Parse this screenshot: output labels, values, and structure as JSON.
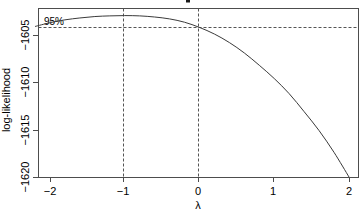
{
  "chart_data": {
    "type": "line",
    "title": "",
    "xlabel": "λ",
    "ylabel": "log-likelihood",
    "xlim": [
      -2.2,
      2.05
    ],
    "ylim": [
      -1620.4,
      -1602.6
    ],
    "grid": false,
    "legend": null,
    "xticks": [
      -2,
      -1,
      0,
      1,
      2
    ],
    "xtick_labels": [
      "−2",
      "−1",
      "0",
      "1",
      "2"
    ],
    "yticks": [
      -1605,
      -1610,
      -1615,
      -1620
    ],
    "ytick_labels": [
      "−1605",
      "−1610",
      "−1615",
      "−1620"
    ],
    "series": [
      {
        "name": "profile log-likelihood",
        "x": [
          -2.2,
          -2.0,
          -1.8,
          -1.6,
          -1.4,
          -1.2,
          -1.0,
          -0.8,
          -0.6,
          -0.4,
          -0.2,
          0.0,
          0.2,
          0.4,
          0.6,
          0.8,
          1.0,
          1.2,
          1.4,
          1.6,
          1.8,
          2.0
        ],
        "y": [
          -1604.1,
          -1603.7,
          -1603.4,
          -1603.2,
          -1603.05,
          -1602.98,
          -1602.95,
          -1602.98,
          -1603.1,
          -1603.3,
          -1603.65,
          -1604.2,
          -1604.9,
          -1605.8,
          -1606.9,
          -1608.2,
          -1609.6,
          -1611.2,
          -1613.1,
          -1615.1,
          -1617.4,
          -1620.0
        ]
      }
    ],
    "annotations": [
      {
        "name": "ci-level-label",
        "text": "95%",
        "x": -1.95,
        "y": -1603.8
      }
    ],
    "reference_lines": [
      {
        "name": "ci-horizontal",
        "orientation": "horizontal",
        "value": -1604.22,
        "style": "dashed"
      },
      {
        "name": "ci-lower-vertical",
        "orientation": "vertical",
        "value": -1.0,
        "style": "dashed"
      },
      {
        "name": "ci-upper-vertical",
        "orientation": "vertical",
        "value": 0.0,
        "style": "dashed"
      }
    ]
  },
  "axes": {
    "y_title": "log-likelihood",
    "x_title": "λ"
  }
}
